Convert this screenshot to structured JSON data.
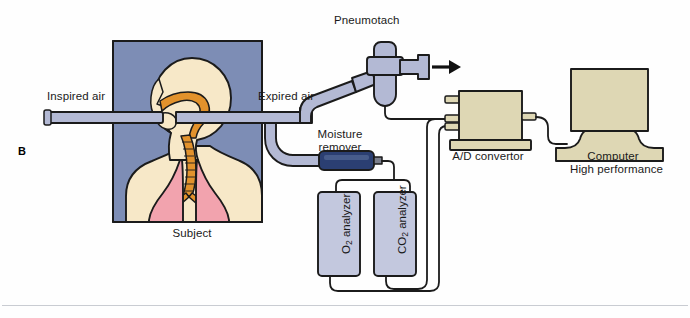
{
  "figure": {
    "panel_letter": "B",
    "kind": "diagram"
  },
  "labels": {
    "inspired_air": "Inspired air",
    "expired_air": "Expired air",
    "pneumotach": "Pneumotach",
    "moisture_remover_line1": "Moisture",
    "moisture_remover_line2": "remover",
    "subject": "Subject",
    "ad_convertor": "A/D convertor",
    "computer_line1": "Computer",
    "computer_line2": "High performance",
    "o2_analyzer_prefix": "O",
    "o2_analyzer_sub": "2",
    "o2_analyzer_suffix": " analyzer",
    "co2_analyzer_prefix": "CO",
    "co2_analyzer_sub": "2",
    "co2_analyzer_suffix": " analyzer"
  },
  "components": [
    {
      "name": "subject-panel",
      "label": "Subject",
      "type": "illustration-panel"
    },
    {
      "name": "pneumotach",
      "label": "Pneumotach",
      "type": "device"
    },
    {
      "name": "moisture-remover",
      "label": "Moisture remover",
      "type": "device"
    },
    {
      "name": "o2-analyzer",
      "label": "O2 analyzer",
      "type": "device"
    },
    {
      "name": "co2-analyzer",
      "label": "CO2 analyzer",
      "type": "device"
    },
    {
      "name": "ad-convertor",
      "label": "A/D convertor",
      "type": "device"
    },
    {
      "name": "computer",
      "label": "Computer High performance",
      "type": "device"
    }
  ],
  "colors": {
    "background": "#fefefe",
    "panel_blue": "#7d8db5",
    "skin": "#f7e8c8",
    "airway_orange": "#e2922c",
    "lung_pink": "#f2a3ae",
    "tube_gray": "#b3b9d4",
    "analyzer_body": "#c3c8de",
    "moisture_navy": "#2b3f72",
    "device_tan": "#ded7b4",
    "outline": "#1b1b1b",
    "rule": "#c9ccd2"
  },
  "flow": {
    "inspired_direction": "left-to-subject",
    "expired_direction": "subject-to-right",
    "vent_arrow": "right"
  }
}
